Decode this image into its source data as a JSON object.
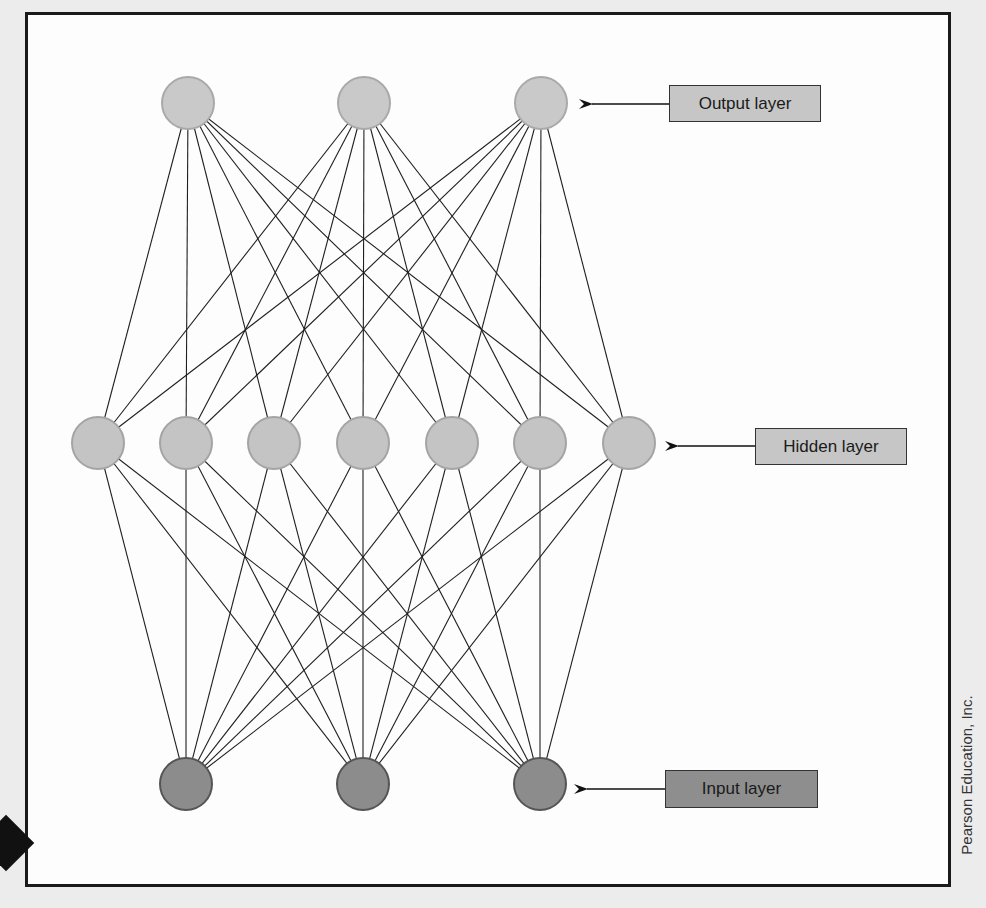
{
  "diagram": {
    "type": "neural-network",
    "layers": [
      {
        "name": "Output layer",
        "label": "Output layer",
        "nodes": 3,
        "fill": "#c9c9c9",
        "stroke": "#a9a9a9",
        "positions": [
          [
            188,
            103
          ],
          [
            364,
            103
          ],
          [
            541,
            103
          ]
        ]
      },
      {
        "name": "Hidden layer",
        "label": "Hidden layer",
        "nodes": 7,
        "fill": "#c4c4c4",
        "stroke": "#a4a4a4",
        "positions": [
          [
            98,
            443
          ],
          [
            186,
            443
          ],
          [
            274,
            443
          ],
          [
            363,
            443
          ],
          [
            452,
            443
          ],
          [
            540,
            443
          ],
          [
            629,
            443
          ]
        ]
      },
      {
        "name": "Input layer",
        "label": "Input layer",
        "nodes": 3,
        "fill": "#8c8c8c",
        "stroke": "#555555",
        "positions": [
          [
            186,
            784
          ],
          [
            363,
            784
          ],
          [
            540,
            784
          ]
        ]
      }
    ],
    "connections": "fully-connected between adjacent layers",
    "node_radius": 26
  },
  "labels": {
    "output": {
      "text": "Output layer",
      "box": [
        669,
        85,
        152,
        37
      ],
      "fill": "#c6c6c6",
      "arrow_from": 669,
      "arrow_to": 580,
      "y": 104
    },
    "hidden": {
      "text": "Hidden layer",
      "box": [
        755,
        428,
        152,
        37
      ],
      "fill": "#c6c6c6",
      "arrow_from": 755,
      "arrow_to": 666,
      "y": 446
    },
    "input": {
      "text": "Input layer",
      "box": [
        665,
        770,
        153,
        38
      ],
      "fill": "#8e8e8e",
      "arrow_from": 665,
      "arrow_to": 575,
      "y": 789
    }
  },
  "credit": "Pearson Education, Inc."
}
